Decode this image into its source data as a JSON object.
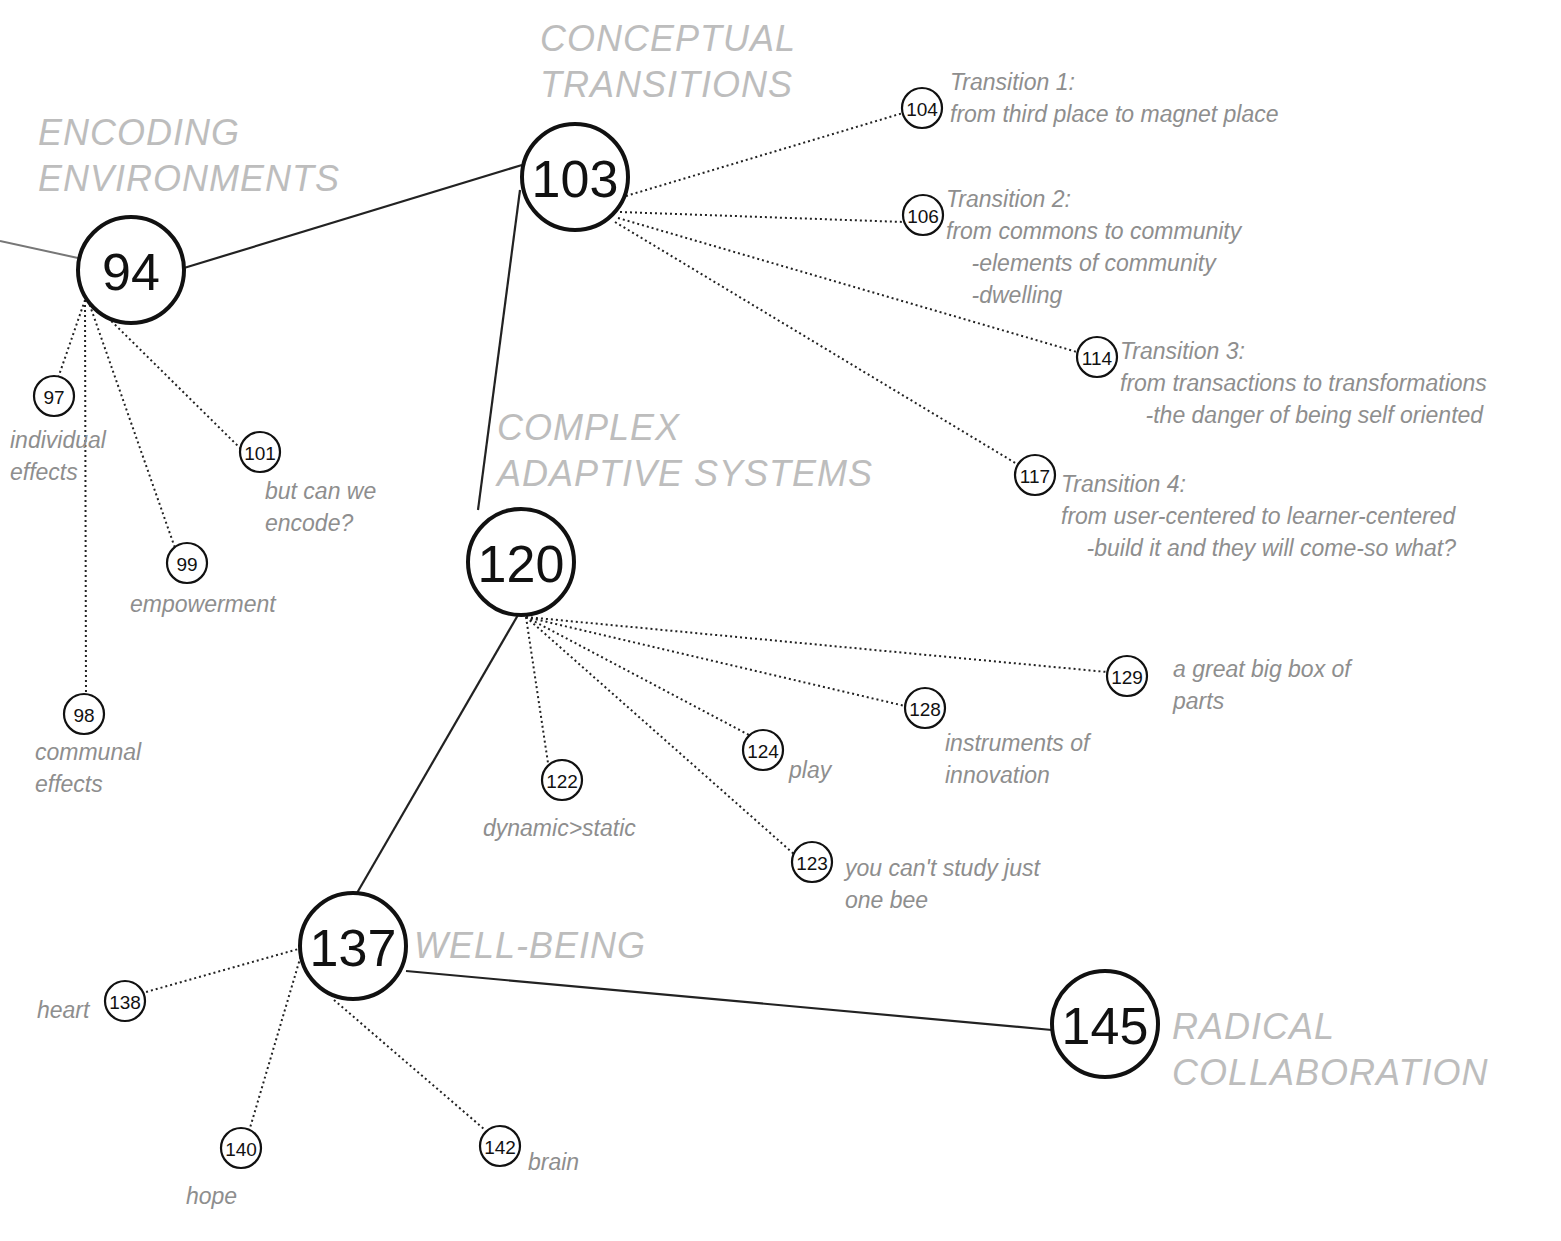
{
  "sections": [
    {
      "id": "encoding",
      "title": "ENCODING\nENVIRONMENTS",
      "node": "94"
    },
    {
      "id": "conceptual",
      "title": "CONCEPTUAL\nTRANSITIONS",
      "node": "103"
    },
    {
      "id": "complex",
      "title": "COMPLEX\nADAPTIVE SYSTEMS",
      "node": "120"
    },
    {
      "id": "wellbeing",
      "title": "WELL-BEING",
      "node": "137"
    },
    {
      "id": "radical",
      "title": "RADICAL\nCOLLABORATION",
      "node": "145"
    }
  ],
  "major_nodes": [
    {
      "label": "94",
      "x": 131,
      "y": 270,
      "r": 53
    },
    {
      "label": "103",
      "x": 575,
      "y": 177,
      "r": 53
    },
    {
      "label": "120",
      "x": 521,
      "y": 562,
      "r": 53
    },
    {
      "label": "137",
      "x": 353,
      "y": 946,
      "r": 53
    },
    {
      "label": "145",
      "x": 1105,
      "y": 1024,
      "r": 53
    }
  ],
  "minor_nodes": [
    {
      "label": "97",
      "x": 54,
      "y": 396,
      "note": "individual\neffects"
    },
    {
      "label": "98",
      "x": 84,
      "y": 714,
      "note": "communal\neffects"
    },
    {
      "label": "99",
      "x": 187,
      "y": 563,
      "note": "empowerment"
    },
    {
      "label": "101",
      "x": 260,
      "y": 452,
      "note": "but can we\nencode?"
    },
    {
      "label": "104",
      "x": 922,
      "y": 108,
      "note": "Transition 1:\nfrom third place to magnet place"
    },
    {
      "label": "106",
      "x": 923,
      "y": 215,
      "note": "Transition 2:\nfrom commons to community\n    -elements of community\n    -dwelling"
    },
    {
      "label": "114",
      "x": 1097,
      "y": 357,
      "note": "Transition 3:\nfrom transactions to transformations\n    -the danger of being self oriented"
    },
    {
      "label": "117",
      "x": 1035,
      "y": 475,
      "note": "Transition 4:\nfrom user-centered to learner-centered\n    -build it and they will come-so what?"
    },
    {
      "label": "122",
      "x": 562,
      "y": 780,
      "note": "dynamic>static"
    },
    {
      "label": "123",
      "x": 812,
      "y": 862,
      "note": "you can't study just\none bee"
    },
    {
      "label": "124",
      "x": 763,
      "y": 750,
      "note": "play"
    },
    {
      "label": "128",
      "x": 925,
      "y": 708,
      "note": "instruments of\ninnovation"
    },
    {
      "label": "129",
      "x": 1127,
      "y": 676,
      "note": "a great big box of\nparts"
    },
    {
      "label": "138",
      "x": 125,
      "y": 1001,
      "note": "heart"
    },
    {
      "label": "140",
      "x": 241,
      "y": 1148,
      "note": "hope"
    },
    {
      "label": "142",
      "x": 500,
      "y": 1146,
      "note": "brain"
    }
  ]
}
